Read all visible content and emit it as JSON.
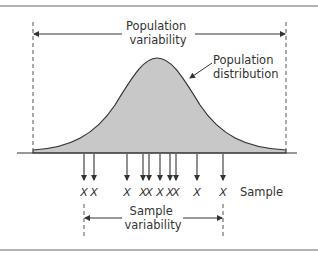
{
  "diagram": {
    "population_variability": {
      "line1": "Population",
      "line2": "variability"
    },
    "population_distribution": {
      "line1": "Population",
      "line2": "distribution"
    },
    "sample_label": "Sample",
    "sample_variability": {
      "line1": "Sample",
      "line2": "variability"
    },
    "sample_marker": "X",
    "sample_positions": [
      84,
      94,
      127,
      143,
      149,
      160,
      170,
      176,
      197,
      223
    ],
    "colors": {
      "fill": "#c8c8c8",
      "stroke": "#333333",
      "rule": "#9a9a9a"
    }
  }
}
